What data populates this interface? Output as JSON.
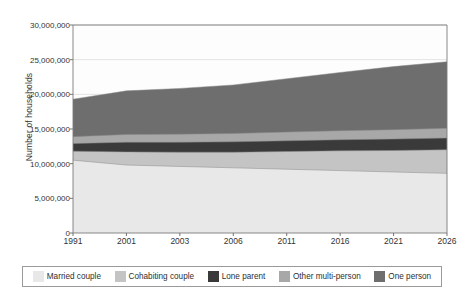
{
  "chart_data": {
    "type": "area",
    "title": "",
    "xlabel": "",
    "ylabel": "Number of households",
    "x": [
      "1991",
      "2001",
      "2003",
      "2006",
      "2011",
      "2016",
      "2021",
      "2026"
    ],
    "categories": [
      "1991",
      "2001",
      "2003",
      "2006",
      "2011",
      "2016",
      "2021",
      "2026"
    ],
    "ylim": [
      0,
      30000000
    ],
    "ytick_labels": [
      "0",
      "5,000,000",
      "10,000,000",
      "15,000,000",
      "20,000,000",
      "25,000,000",
      "30,000,000"
    ],
    "ytick_values": [
      0,
      5000000,
      10000000,
      15000000,
      20000000,
      25000000,
      30000000
    ],
    "grid": true,
    "stacked": true,
    "legend_position": "bottom",
    "series": [
      {
        "name": "Married couple",
        "color": "#e8e8e8",
        "values": [
          10500000,
          9800000,
          9600000,
          9400000,
          9200000,
          9000000,
          8800000,
          8600000
        ]
      },
      {
        "name": "Cohabiting couple",
        "color": "#c4c4c4",
        "values": [
          1300000,
          1900000,
          2050000,
          2250000,
          2550000,
          2850000,
          3100000,
          3400000
        ]
      },
      {
        "name": "Lone parent",
        "color": "#3a3a3a",
        "values": [
          1100000,
          1400000,
          1450000,
          1500000,
          1550000,
          1600000,
          1650000,
          1700000
        ]
      },
      {
        "name": "Other multi-person",
        "color": "#a8a8a8",
        "values": [
          1000000,
          1100000,
          1150000,
          1200000,
          1250000,
          1300000,
          1350000,
          1400000
        ]
      },
      {
        "name": "One person",
        "color": "#6e6e6e",
        "values": [
          5400000,
          6300000,
          6600000,
          7000000,
          7700000,
          8400000,
          9100000,
          9600000
        ]
      }
    ],
    "series_totals": [
      19300000,
      20500000,
      20850000,
      21350000,
      22250000,
      23150000,
      24000000,
      24700000
    ],
    "annotations": []
  },
  "legend": {
    "items": [
      {
        "label": "Married couple"
      },
      {
        "label": "Cohabiting couple"
      },
      {
        "label": "Lone parent"
      },
      {
        "label": "Other multi-person"
      },
      {
        "label": "One person"
      }
    ]
  }
}
